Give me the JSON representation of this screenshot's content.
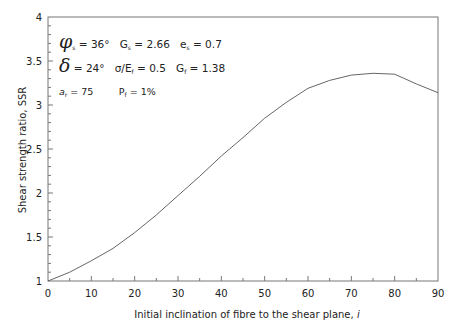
{
  "chart_data": {
    "type": "line",
    "title": "",
    "xlabel": "Initial inclination of fibre to the shear plane, i",
    "xlabel_text": "Initial inclination of fibre to the shear plane,",
    "xlabel_var": "i",
    "ylabel": "Shear strength ratio, SSR",
    "xlim": [
      0,
      90
    ],
    "ylim": [
      1,
      4
    ],
    "x_ticks": [
      0,
      10,
      20,
      30,
      40,
      50,
      60,
      70,
      80,
      90
    ],
    "x_tick_labels": [
      "0",
      "10",
      "20",
      "30",
      "40",
      "50",
      "60",
      "70",
      "80",
      "90"
    ],
    "x_minor_step": 5,
    "y_ticks": [
      1,
      1.5,
      2,
      2.5,
      3,
      3.5,
      4
    ],
    "y_tick_labels": [
      "1",
      "1.5",
      "2",
      "2.5",
      "3",
      "3.5",
      "4"
    ],
    "y_minor_step": 0.1,
    "grid": false,
    "legend": null,
    "series": [
      {
        "name": "SSR",
        "x": [
          0,
          5,
          10,
          15,
          20,
          25,
          30,
          35,
          40,
          45,
          50,
          55,
          60,
          65,
          70,
          75,
          80,
          85,
          90
        ],
        "values": [
          1.0,
          1.1,
          1.23,
          1.37,
          1.55,
          1.75,
          1.97,
          2.19,
          2.42,
          2.63,
          2.85,
          3.03,
          3.19,
          3.28,
          3.34,
          3.36,
          3.35,
          3.24,
          3.14
        ],
        "color": "#555555"
      }
    ],
    "annotations": [
      "φs = 36°  Gs = 2.66  es = 0.7",
      "δ = 24°  σ/Ef = 0.5  Gf = 1.38",
      "ar = 75   Pf = 1%"
    ]
  },
  "annotation": {
    "line1": {
      "phi_sym": "φ",
      "phi_sub": "s",
      "phi_val": " = 36°",
      "gs_sym": "G",
      "gs_sub": "s",
      "gs_val": " = 2.66",
      "es_sym": "e",
      "es_sub": "s",
      "es_val": " = 0.7"
    },
    "line2": {
      "delta_sym": "δ",
      "delta_val": " = 24°",
      "sig_sym": "σ/E",
      "sig_sub": "f",
      "sig_val": " = 0.5",
      "gf_sym": "G",
      "gf_sub": "f",
      "gf_val": " = 1.38"
    },
    "line3": {
      "ar_sym": "a",
      "ar_sub": "r",
      "ar_val": " = 75",
      "pf_sym": "P",
      "pf_sub": "f",
      "pf_val": " = 1%"
    }
  }
}
